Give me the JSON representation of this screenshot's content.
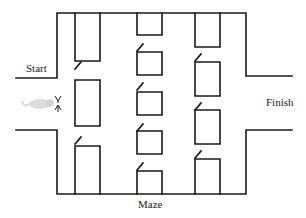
{
  "diagram": {
    "title": "Maze",
    "labels": {
      "start": "Start",
      "finish": "Finish",
      "caption": "Maze"
    },
    "colors": {
      "line": "#1a1a1a",
      "background": "#ffffff",
      "mouse": "#d8d8d8"
    },
    "structure": {
      "columns": 3,
      "doors_per_column": [
        2,
        4,
        3
      ],
      "boxes_per_column": [
        3,
        5,
        4
      ]
    }
  }
}
